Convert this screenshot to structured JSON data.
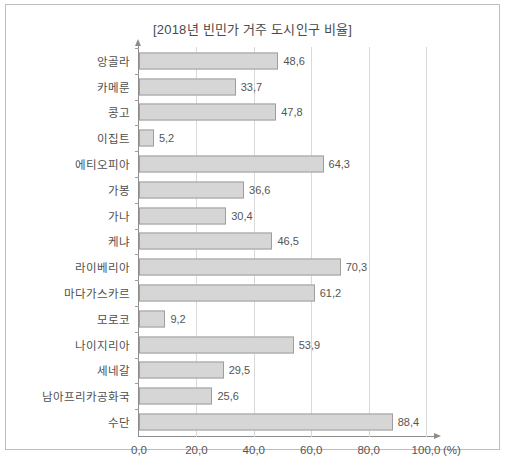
{
  "chart_data": {
    "type": "bar",
    "orientation": "horizontal",
    "title": "[2018년 빈민가 거주 도시인구 비율]",
    "xlabel": "(%)",
    "ylabel": "",
    "xlim": [
      0,
      100
    ],
    "grid": true,
    "legend": "none",
    "xticks": [
      "0,0",
      "20,0",
      "40,0",
      "60,0",
      "80,0",
      "100,0"
    ],
    "xtick_values": [
      0,
      20,
      40,
      60,
      80,
      100
    ],
    "decimal_separator": ",",
    "categories": [
      "앙골라",
      "카메룬",
      "콩고",
      "이집트",
      "에티오피아",
      "가봉",
      "가나",
      "케냐",
      "라이베리아",
      "마다가스카르",
      "모로코",
      "나이지리아",
      "세네갈",
      "남아프리카공화국",
      "수단"
    ],
    "values": [
      48.6,
      33.7,
      47.8,
      5.2,
      64.3,
      36.6,
      30.4,
      46.5,
      70.3,
      61.2,
      9.2,
      53.9,
      29.5,
      25.6,
      88.4
    ],
    "value_labels": [
      "48,6",
      "33,7",
      "47,8",
      "5,2",
      "64,3",
      "36,6",
      "30,4",
      "46,5",
      "70,3",
      "61,2",
      "9,2",
      "53,9",
      "29,5",
      "25,6",
      "88,4"
    ],
    "colors": {
      "bar_fill": "#d6d6d6",
      "bar_border": "#9e9e9e",
      "gridline": "#d9d9d9",
      "axis": "#8c8c8c",
      "text": "#555555",
      "frame": "#bdbdbd"
    }
  }
}
